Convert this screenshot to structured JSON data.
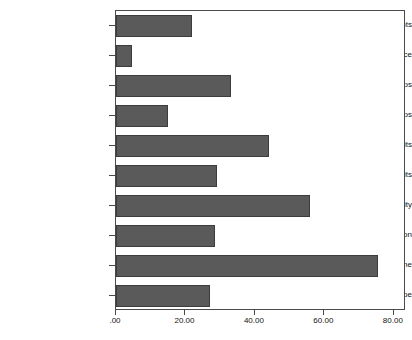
{
  "chart_data": {
    "type": "bar",
    "orientation": "horizontal",
    "title": "",
    "subtitle": "",
    "xlabel": "",
    "ylabel": "",
    "grid": false,
    "legend": false,
    "legend_position": "none",
    "xlim": [
      0,
      83.5
    ],
    "xticks": [
      0,
      20,
      40,
      60,
      80
    ],
    "xtick_labels": [
      ".00",
      "20.00",
      "40.00",
      "60.00",
      "80.00"
    ],
    "bar_color": "#5a5a5a",
    "bar_edge_color": "#3c3c3c",
    "axis_color": "#4a4a4a",
    "plot_background": "#ffffff",
    "categories": [
      "Campaign Complaints",
      "Campaign Advice",
      "Unhelpful Groups",
      "Helpful Groups",
      "Negative Leadership Traits",
      "Positive Leadership Traits",
      "Evidence of Disunity",
      "Evidence of Coordination",
      "Agents of Decline",
      "Agents of Hope"
    ],
    "values": [
      22,
      4.5,
      33,
      15,
      44,
      29,
      56,
      28.5,
      75.5,
      27
    ]
  }
}
